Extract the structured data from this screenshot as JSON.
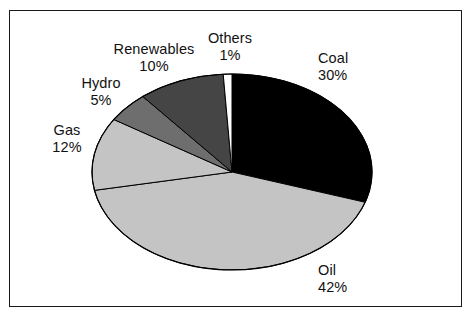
{
  "figure": {
    "background_color": "#ffffff",
    "frame_color": "#1a1a1a",
    "width": 473,
    "height": 320
  },
  "chart_data": {
    "type": "pie",
    "title": "",
    "subtitle": "",
    "xlabel": "",
    "ylabel": "",
    "grid": false,
    "legend_position": "none",
    "label_format": "name above percent",
    "start_angle_deg": 0,
    "direction": "clockwise",
    "total": 100,
    "unit": "%",
    "categories": [
      "Coal",
      "Oil",
      "Gas",
      "Hydro",
      "Renewables",
      "Others"
    ],
    "values": [
      30,
      42,
      12,
      5,
      10,
      1
    ],
    "slices": [
      {
        "name": "Coal",
        "value": 30,
        "percent_label": "30%",
        "color": "#000000",
        "edge_color": "#000000"
      },
      {
        "name": "Oil",
        "value": 42,
        "percent_label": "42%",
        "color": "#c4c4c4",
        "edge_color": "#000000"
      },
      {
        "name": "Gas",
        "value": 12,
        "percent_label": "12%",
        "color": "#c4c4c4",
        "edge_color": "#000000"
      },
      {
        "name": "Hydro",
        "value": 5,
        "percent_label": "5%",
        "color": "#6e6e6e",
        "edge_color": "#000000"
      },
      {
        "name": "Renewables",
        "value": 10,
        "percent_label": "10%",
        "color": "#454545",
        "edge_color": "#000000"
      },
      {
        "name": "Others",
        "value": 1,
        "percent_label": "1%",
        "color": "#ffffff",
        "edge_color": "#000000"
      }
    ],
    "geometry": {
      "center_x": 232,
      "center_y": 172,
      "radius_x": 140,
      "radius_y": 98
    }
  },
  "labels": {
    "coal": {
      "name": "Coal",
      "value": "30%"
    },
    "oil": {
      "name": "Oil",
      "value": "42%"
    },
    "gas": {
      "name": "Gas",
      "value": "12%"
    },
    "hydro": {
      "name": "Hydro",
      "value": "5%"
    },
    "renewables": {
      "name": "Renewables",
      "value": "10%"
    },
    "others": {
      "name": "Others",
      "value": "1%"
    }
  }
}
